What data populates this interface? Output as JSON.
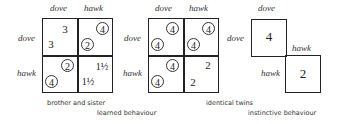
{
  "diagrams": [
    {
      "id": "brother-sister",
      "col_labels": [
        "dove",
        "hawk"
      ],
      "row_labels": [
        "dove",
        "hawk"
      ],
      "cells": {
        "dd": {
          "top_right": "3",
          "bottom_left": "3",
          "tr_circled": false,
          "bl_circled": false
        },
        "dh": {
          "top_right": "4",
          "bottom_left": "2",
          "tr_circled": true,
          "bl_circled": true
        },
        "hd": {
          "top_right": "2",
          "bottom_left": "4",
          "tr_circled": true,
          "bl_circled": true
        },
        "hh": {
          "top_right": "1½",
          "bottom_left": "1½",
          "tr_circled": false,
          "bl_circled": false
        }
      },
      "caption": "brother and sister"
    },
    {
      "id": "identical-twins",
      "col_labels": [
        "dove",
        "hawk"
      ],
      "row_labels": [
        "dove",
        "hawk"
      ],
      "cells": {
        "dd": {
          "top_right": "4",
          "bottom_left": "4",
          "tr_circled": true,
          "bl_circled": true
        },
        "dh": {
          "top_right": "4",
          "bottom_left": "4",
          "tr_circled": true,
          "bl_circled": true
        },
        "hd": {
          "top_right": "4",
          "bottom_left": "4",
          "tr_circled": true,
          "bl_circled": true
        },
        "hh": {
          "top_right": "2",
          "bottom_left": "2",
          "tr_circled": false,
          "bl_circled": false
        }
      },
      "caption": "identical twins"
    },
    {
      "id": "instinctive",
      "col_labels": [
        "dove",
        "hawk"
      ],
      "row_labels": [
        "dove",
        "hawk"
      ],
      "cells": {
        "dd": {
          "value": "4"
        },
        "hh": {
          "value": "2"
        }
      }
    }
  ],
  "captions": {
    "brother_sister": "brother and sister",
    "learned": "learned behaviour",
    "identical_twins": "identical twins",
    "instinctive": "instinctive behaviour"
  }
}
